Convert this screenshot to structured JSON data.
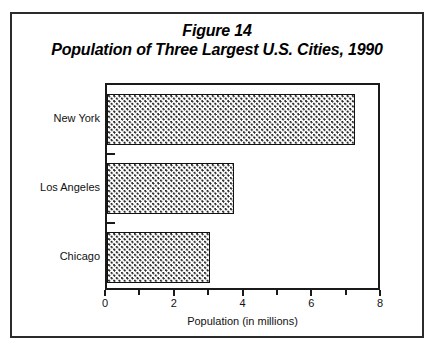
{
  "figure": {
    "title_line_1": "Figure 14",
    "title_line_2": "Population of Three Largest U.S. Cities, 1990",
    "border_color": "#2b2b2b"
  },
  "chart_data": {
    "type": "bar",
    "orientation": "horizontal",
    "categories": [
      "New York",
      "Los Angeles",
      "Chicago"
    ],
    "values": [
      7.2,
      3.7,
      3.0
    ],
    "xlabel": "Population (in millions)",
    "ylabel": "",
    "xlim": [
      0,
      8
    ],
    "xticks": [
      0,
      1,
      2,
      3,
      4,
      5,
      6,
      7,
      8
    ],
    "xtick_labels": [
      "0",
      "",
      "2",
      "",
      "4",
      "",
      "6",
      "",
      "8"
    ],
    "grid": false,
    "legend": false,
    "bar_fill": "dotted-stipple",
    "bar_edge_color": "#111111"
  },
  "axis": {
    "x_title": "Population (in millions)",
    "x_labels": [
      {
        "value": 0,
        "text": "0"
      },
      {
        "value": 2,
        "text": "2"
      },
      {
        "value": 4,
        "text": "4"
      },
      {
        "value": 6,
        "text": "6"
      },
      {
        "value": 8,
        "text": "8"
      }
    ],
    "y_categories": [
      {
        "label": "New York",
        "value": 7.2
      },
      {
        "label": "Los Angeles",
        "value": 3.7
      },
      {
        "label": "Chicago",
        "value": 3.0
      }
    ]
  }
}
